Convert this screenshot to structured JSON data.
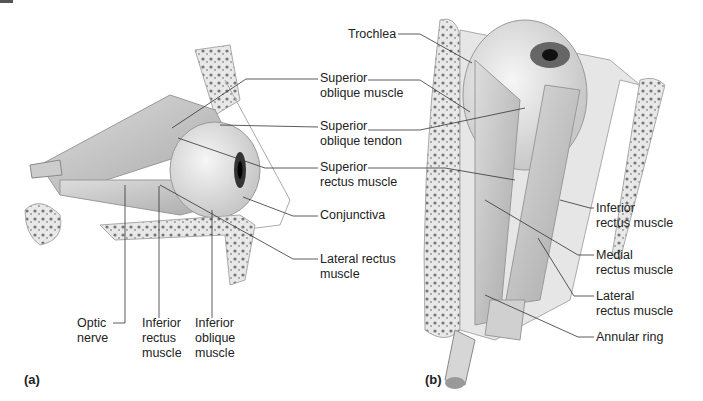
{
  "figure": {
    "panel_a": {
      "label": "(a)",
      "labels": [
        {
          "id": "superior-oblique-muscle",
          "line1": "Superior",
          "line2": "oblique muscle"
        },
        {
          "id": "superior-oblique-tendon",
          "line1": "Superior",
          "line2": "oblique tendon"
        },
        {
          "id": "superior-rectus-muscle",
          "line1": "Superior",
          "line2": "rectus muscle"
        },
        {
          "id": "conjunctiva",
          "line1": "Conjunctiva"
        },
        {
          "id": "lateral-rectus-muscle",
          "line1": "Lateral rectus",
          "line2": "muscle"
        },
        {
          "id": "optic-nerve",
          "line1": "Optic",
          "line2": "nerve"
        },
        {
          "id": "inferior-rectus-muscle",
          "line1": "Inferior",
          "line2": "rectus",
          "line3": "muscle"
        },
        {
          "id": "inferior-oblique-muscle",
          "line1": "Inferior",
          "line2": "oblique",
          "line3": "muscle"
        }
      ]
    },
    "panel_b": {
      "label": "(b)",
      "labels": [
        {
          "id": "trochlea",
          "line1": "Trochlea"
        },
        {
          "id": "inferior-rectus-muscle",
          "line1": "Inferior",
          "line2": "rectus muscle"
        },
        {
          "id": "medial-rectus-muscle",
          "line1": "Medial",
          "line2": "rectus muscle"
        },
        {
          "id": "lateral-rectus-muscle",
          "line1": "Lateral",
          "line2": "rectus muscle"
        },
        {
          "id": "annular-ring",
          "line1": "Annular ring"
        }
      ]
    }
  }
}
